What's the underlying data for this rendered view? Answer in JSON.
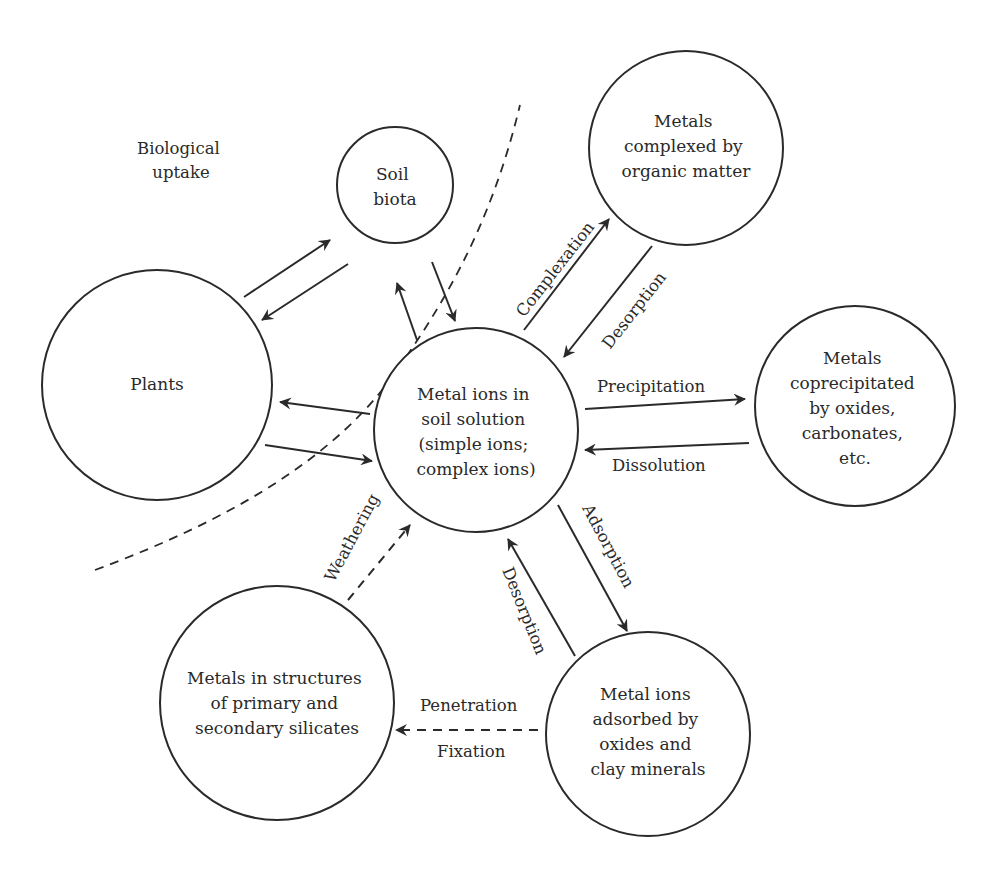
{
  "diagram": {
    "region_label": [
      "Biological",
      "uptake"
    ],
    "nodes": {
      "soil_solution": {
        "lines": [
          "Metal ions in",
          "soil solution",
          "(simple ions;",
          "complex ions)"
        ]
      },
      "soil_biota": {
        "lines": [
          "Soil",
          "biota"
        ]
      },
      "plants": {
        "lines": [
          "Plants"
        ]
      },
      "organic_complexes": {
        "lines": [
          "Metals",
          "complexed by",
          "organic matter"
        ]
      },
      "coprecipitated": {
        "lines": [
          "Metals",
          "coprecipitated",
          "by oxides,",
          "carbonates,",
          "etc."
        ]
      },
      "adsorbed": {
        "lines": [
          "Metal ions",
          "adsorbed by",
          "oxides and",
          "clay minerals"
        ]
      },
      "silicates": {
        "lines": [
          "Metals in structures",
          "of primary and",
          "secondary silicates"
        ]
      }
    },
    "edges": {
      "complexation": "Complexation",
      "desorption_organic": "Desorption",
      "precipitation": "Precipitation",
      "dissolution": "Dissolution",
      "adsorption": "Adsorption",
      "desorption_mineral": "Desorption",
      "penetration": "Penetration",
      "fixation": "Fixation",
      "weathering": "Weathering"
    },
    "colors": {
      "ink": "#2a2a2a",
      "background": "#ffffff"
    }
  }
}
